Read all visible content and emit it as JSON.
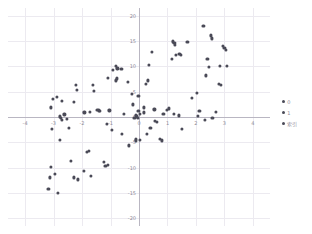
{
  "chart_data": {
    "type": "scatter",
    "title": "",
    "xlabel": "",
    "ylabel": "",
    "xlim": [
      -4.6,
      4.6
    ],
    "ylim": [
      -21.5,
      21.5
    ],
    "xticks": [
      "-4",
      "-3",
      "-2",
      "-1",
      "0",
      "1",
      "2",
      "3",
      "4"
    ],
    "xtick_values": [
      -4,
      -3,
      -2,
      -1,
      0,
      1,
      2,
      3,
      4
    ],
    "yticks": [
      "20",
      "15",
      "10",
      "5",
      "0",
      "-5",
      "-10",
      "-15",
      "-20"
    ],
    "ytick_values": [
      20,
      15,
      10,
      5,
      0,
      -5,
      -10,
      -15,
      -20
    ],
    "grid": true,
    "legend_position": "right",
    "marker_color": "#4a4a57",
    "grid_color": "#eceaf0",
    "axis_color": "#b9b6c2",
    "tick_color": "#8f8c98",
    "legend": [
      {
        "label": "0",
        "color": "#4a4a57"
      },
      {
        "label": "1",
        "color": "#4a4a57"
      },
      {
        "label": "索引",
        "color": "#4a4a57"
      }
    ],
    "points": [
      [
        -3.02,
        3.6
      ],
      [
        -2.88,
        4.0
      ],
      [
        -3.08,
        1.9
      ],
      [
        -2.72,
        3.2
      ],
      [
        -2.78,
        0.1
      ],
      [
        -2.74,
        -0.2
      ],
      [
        -2.7,
        -0.5
      ],
      [
        -2.62,
        0.5
      ],
      [
        -2.52,
        -0.3
      ],
      [
        -2.3,
        2.9
      ],
      [
        -2.22,
        6.3
      ],
      [
        -2.18,
        5.4
      ],
      [
        -1.92,
        0.9
      ],
      [
        -1.72,
        1.0
      ],
      [
        -1.62,
        6.4
      ],
      [
        -1.58,
        5.2
      ],
      [
        -1.46,
        1.4
      ],
      [
        -1.4,
        1.3
      ],
      [
        -1.36,
        1.2
      ],
      [
        -1.1,
        7.7
      ],
      [
        -1.04,
        1.3
      ],
      [
        -0.92,
        9.3
      ],
      [
        -0.82,
        10.0
      ],
      [
        -0.78,
        7.6
      ],
      [
        -0.8,
        7.2
      ],
      [
        -0.76,
        9.6
      ],
      [
        -0.62,
        9.5
      ],
      [
        -0.54,
        0.6
      ],
      [
        -0.4,
        7.0
      ],
      [
        -0.24,
        4.5
      ],
      [
        -0.22,
        2.5
      ],
      [
        -0.12,
        0.3
      ],
      [
        -0.08,
        0.2
      ],
      [
        -0.06,
        0.0
      ],
      [
        -0.04,
        -0.1
      ],
      [
        0.16,
        1.9
      ],
      [
        0.18,
        0.9
      ],
      [
        0.24,
        6.6
      ],
      [
        0.3,
        7.2
      ],
      [
        0.36,
        10.3
      ],
      [
        0.46,
        12.9
      ],
      [
        0.62,
        -1.0
      ],
      [
        0.72,
        -4.4
      ],
      [
        0.8,
        -4.6
      ],
      [
        0.98,
        1.4
      ],
      [
        1.06,
        1.7
      ],
      [
        1.16,
        11.4
      ],
      [
        1.2,
        14.9
      ],
      [
        1.24,
        14.6
      ],
      [
        1.26,
        14.2
      ],
      [
        1.3,
        12.3
      ],
      [
        1.42,
        12.5
      ],
      [
        1.46,
        12.2
      ],
      [
        1.52,
        -2.4
      ],
      [
        1.7,
        14.8
      ],
      [
        1.86,
        3.7
      ],
      [
        2.02,
        4.7
      ],
      [
        2.06,
        0.2
      ],
      [
        2.26,
        17.9
      ],
      [
        2.34,
        8.2
      ],
      [
        2.4,
        11.5
      ],
      [
        2.46,
        9.9
      ],
      [
        2.52,
        16.1
      ],
      [
        2.56,
        15.5
      ],
      [
        2.58,
        -0.2
      ],
      [
        2.7,
        1.0
      ],
      [
        2.8,
        6.6
      ],
      [
        2.84,
        10.0
      ],
      [
        2.88,
        6.4
      ],
      [
        2.94,
        14.0
      ],
      [
        3.0,
        13.6
      ],
      [
        3.04,
        13.2
      ],
      [
        3.08,
        10.0
      ],
      [
        -3.06,
        -2.3
      ],
      [
        -3.08,
        -9.8
      ],
      [
        -3.14,
        -11.9
      ],
      [
        -3.18,
        -14.2
      ],
      [
        -2.96,
        -11.3
      ],
      [
        -2.86,
        -14.9
      ],
      [
        -2.78,
        -4.5
      ],
      [
        -2.46,
        -2.2
      ],
      [
        -2.4,
        -8.6
      ],
      [
        -2.28,
        -11.9
      ],
      [
        -2.14,
        -12.3
      ],
      [
        -1.94,
        -10.6
      ],
      [
        -1.82,
        -6.9
      ],
      [
        -1.76,
        -6.7
      ],
      [
        -1.7,
        -11.6
      ],
      [
        -1.24,
        -8.9
      ],
      [
        -1.18,
        -9.6
      ],
      [
        -1.1,
        -9.5
      ],
      [
        -1.14,
        -1.4
      ],
      [
        -0.96,
        -2.6
      ],
      [
        -0.6,
        -3.3
      ],
      [
        -0.36,
        -5.6
      ],
      [
        -0.12,
        -4.3
      ],
      [
        -0.1,
        -4.6
      ],
      [
        0.04,
        -4.5
      ],
      [
        0.28,
        -3.3
      ],
      [
        0.4,
        -2.1
      ],
      [
        0.56,
        -0.7
      ],
      [
        1.22,
        0.6
      ],
      [
        1.4,
        0.3
      ],
      [
        2.12,
        1.2
      ],
      [
        2.32,
        -0.6
      ],
      [
        -0.02,
        4.2
      ],
      [
        -0.02,
        1.2
      ],
      [
        0.02,
        0.6
      ],
      [
        -0.16,
        -0.1
      ],
      [
        0.54,
        1.5
      ],
      [
        0.86,
        0.6
      ]
    ]
  }
}
